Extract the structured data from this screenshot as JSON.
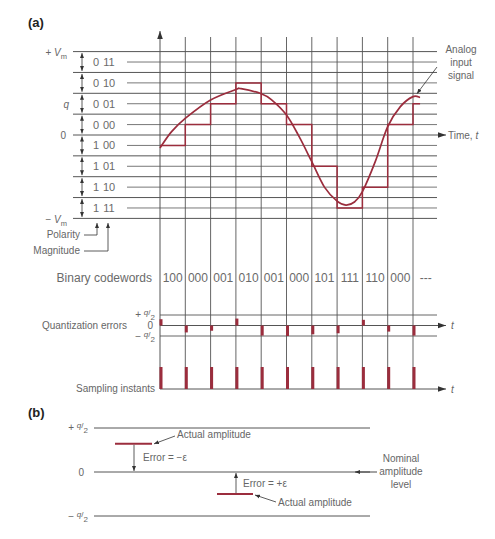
{
  "colors": {
    "signal": "#9b2d3d",
    "grid": "#555555",
    "arrow": "#333333",
    "text": "#666666",
    "heading": "#222222"
  },
  "panel_a": {
    "label": "(a)",
    "y_labels": {
      "pos_vm": {
        "prefix": "+ ",
        "symbol": "V",
        "sub": "m"
      },
      "neg_vm": {
        "prefix": "− ",
        "symbol": "V",
        "sub": "m"
      },
      "step": "q",
      "zero": "0"
    },
    "v_range_q": [
      -4,
      4
    ],
    "levels": [
      {
        "code": "011",
        "value_q": 3.5
      },
      {
        "code": "010",
        "value_q": 2.5
      },
      {
        "code": "001",
        "value_q": 1.5
      },
      {
        "code": "000",
        "value_q": 0.5
      },
      {
        "code": "100",
        "value_q": -0.5
      },
      {
        "code": "101",
        "value_q": -1.5
      },
      {
        "code": "110",
        "value_q": -2.5
      },
      {
        "code": "111",
        "value_q": -3.5
      }
    ],
    "bit_labels": {
      "polarity": "Polarity",
      "magnitude": "Magnitude"
    },
    "time_axis_label": {
      "text": "Time, ",
      "var": "t"
    },
    "signal_label": {
      "line1": "Analog",
      "line2": "input",
      "line3": "signal"
    },
    "codewords_label": "Binary codewords",
    "samples": [
      {
        "t": 0,
        "level_code": "100",
        "codeword": "100",
        "error_q": 0.3
      },
      {
        "t": 1,
        "level_code": "000",
        "codeword": "000",
        "error_q": -0.33
      },
      {
        "t": 2,
        "level_code": "001",
        "codeword": "001",
        "error_q": -0.25
      },
      {
        "t": 3,
        "level_code": "010",
        "codeword": "010",
        "error_q": 0.33
      },
      {
        "t": 4,
        "level_code": "001",
        "codeword": "001",
        "error_q": -0.48
      },
      {
        "t": 5,
        "level_code": "000",
        "codeword": "000",
        "error_q": -0.5
      },
      {
        "t": 6,
        "level_code": "101",
        "codeword": "101",
        "error_q": -0.42
      },
      {
        "t": 7,
        "level_code": "111",
        "codeword": "111",
        "error_q": -0.37
      },
      {
        "t": 8,
        "level_code": "110",
        "codeword": "110",
        "error_q": 0.27
      },
      {
        "t": 9,
        "level_code": "000",
        "codeword": "000",
        "error_q": -0.29
      },
      {
        "t": 10,
        "level_code": "001",
        "codeword": "---",
        "error_q": -0.48
      }
    ],
    "analog_signal": [
      [
        0,
        -0.62
      ],
      [
        0.45,
        0.15
      ],
      [
        1.02,
        0.82
      ],
      [
        2.0,
        1.68
      ],
      [
        3.0,
        2.18
      ],
      [
        3.2,
        2.22
      ],
      [
        4.0,
        1.98
      ],
      [
        4.4,
        1.7
      ],
      [
        5.0,
        0.96
      ],
      [
        5.5,
        -0.08
      ],
      [
        6.0,
        -1.28
      ],
      [
        6.5,
        -2.5
      ],
      [
        7.0,
        -3.17
      ],
      [
        7.35,
        -3.36
      ],
      [
        7.7,
        -3.2
      ],
      [
        8.0,
        -2.72
      ],
      [
        8.5,
        -1.3
      ],
      [
        9.0,
        0.4
      ],
      [
        9.5,
        1.36
      ],
      [
        10.0,
        1.84
      ],
      [
        10.28,
        1.8
      ]
    ],
    "quantization_errors": {
      "label": "Quantization errors",
      "upper": {
        "sign": "+ ",
        "num": "q",
        "slash": "/",
        "den": "2"
      },
      "zero": "0",
      "lower": {
        "sign": "− ",
        "num": "q",
        "slash": "/",
        "den": "2"
      },
      "axis_var": "t"
    },
    "sampling_instants": {
      "label": "Sampling instants",
      "axis_var": "t"
    }
  },
  "panel_b": {
    "label": "(b)",
    "upper": {
      "sign": "+ ",
      "num": "q",
      "slash": "/",
      "den": "2",
      "value_q": 0.5
    },
    "zero": {
      "text": "0",
      "value_q": 0
    },
    "lower": {
      "sign": "− ",
      "num": "q",
      "slash": "/",
      "den": "2",
      "value_q": -0.5
    },
    "actual_above": {
      "value_q": 0.32,
      "label": "Actual amplitude",
      "error_label": "Error = −ε"
    },
    "actual_below": {
      "value_q": -0.25,
      "label": "Actual amplitude",
      "error_label": "Error = +ε"
    },
    "nominal_label": {
      "line1": "Nominal",
      "line2": "amplitude",
      "line3": "level"
    }
  }
}
